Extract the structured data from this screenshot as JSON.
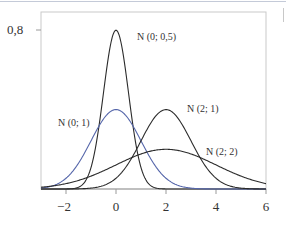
{
  "chart_data": {
    "type": "line",
    "title": "",
    "xlabel": "",
    "ylabel": "",
    "xlim": [
      -3,
      6
    ],
    "ylim": [
      0,
      0.8
    ],
    "grid": false,
    "x_ticks": [
      -2,
      0,
      2,
      4,
      6
    ],
    "x_tick_labels": [
      "−2",
      "0",
      "2",
      "4",
      "6"
    ],
    "y_ticks": [
      0.8
    ],
    "y_tick_labels": [
      "0,8"
    ],
    "series": [
      {
        "name": "N (0; 0,5)",
        "distribution": "normal",
        "mean": 0,
        "sd": 0.5,
        "color": "#2b2b2b",
        "peak": 0.798
      },
      {
        "name": "N (0; 1)",
        "distribution": "normal",
        "mean": 0,
        "sd": 1,
        "color": "#5566aa",
        "peak": 0.399
      },
      {
        "name": "N (2; 1)",
        "distribution": "normal",
        "mean": 2,
        "sd": 1,
        "color": "#2b2b2b",
        "peak": 0.399
      },
      {
        "name": "N (2; 2)",
        "distribution": "normal",
        "mean": 2,
        "sd": 2,
        "color": "#2b2b2b",
        "peak": 0.199
      }
    ],
    "annotations": [
      {
        "text": "N (0; 0,5)",
        "x_px": 137,
        "y_px": 32
      },
      {
        "text": "N (0; 1)",
        "x_px": 58,
        "y_px": 118
      },
      {
        "text": "N (2; 1)",
        "x_px": 187,
        "y_px": 104
      },
      {
        "text": "N (2; 2)",
        "x_px": 206,
        "y_px": 147
      }
    ]
  },
  "labels": {
    "n_0_05": "N (0; 0,5)",
    "n_0_1": "N (0; 1)",
    "n_2_1": "N (2; 1)",
    "n_2_2": "N (2; 2)",
    "ytick_08": "0,8",
    "xtick_m2": "−2",
    "xtick_0": "0",
    "xtick_2": "2",
    "xtick_4": "4",
    "xtick_6": "6"
  }
}
